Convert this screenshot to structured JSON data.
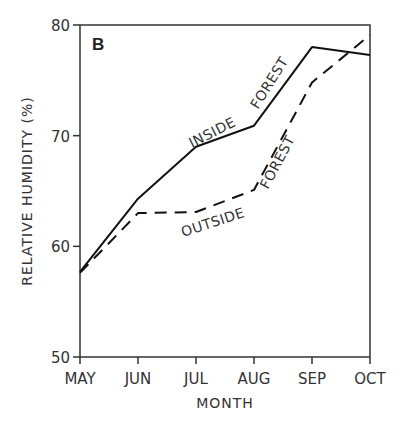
{
  "chart_data": {
    "type": "line",
    "panel_label": "B",
    "title": "",
    "xlabel": "MONTH",
    "ylabel": "RELATIVE HUMIDITY (%)",
    "categories": [
      "MAY",
      "JUN",
      "JUL",
      "AUG",
      "SEP",
      "OCT"
    ],
    "ylim": [
      50,
      80
    ],
    "yticks": [
      50,
      60,
      70,
      80
    ],
    "grid": false,
    "legend": "inline labels along lines",
    "series": [
      {
        "name": "INSIDE FOREST",
        "style": "solid",
        "values": [
          57.7,
          64.3,
          69.0,
          70.9,
          78.0,
          77.3
        ]
      },
      {
        "name": "OUTSIDE FOREST",
        "style": "dashed",
        "values": [
          57.6,
          63.0,
          63.1,
          65.1,
          74.8,
          79.1
        ]
      }
    ]
  }
}
